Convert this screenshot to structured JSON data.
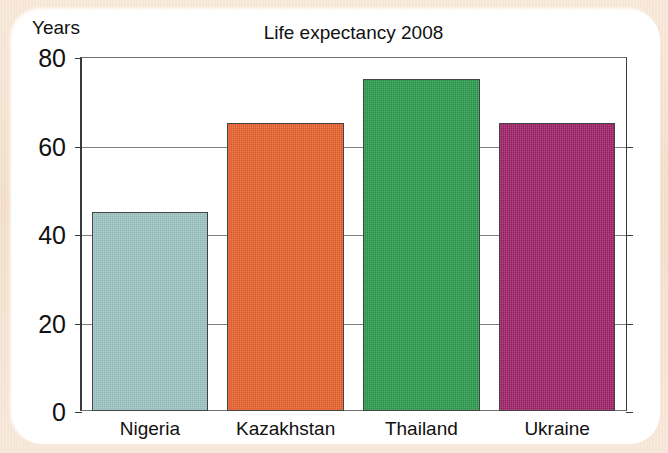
{
  "figure": {
    "background_color": "#f3ddc8",
    "card_color": "#ffffff"
  },
  "chart_data": {
    "type": "bar",
    "title": "Life expectancy 2008",
    "xlabel": "",
    "ylabel": "Years",
    "categories": [
      "Nigeria",
      "Kazakhstan",
      "Thailand",
      "Ukraine"
    ],
    "values": [
      45,
      65,
      75,
      65
    ],
    "colors": [
      "#9cc5c4",
      "#e8612c",
      "#2b9a4b",
      "#9e2168"
    ],
    "ylim": [
      0,
      80
    ],
    "yticks": [
      0,
      20,
      40,
      60,
      80
    ],
    "ytick_labels": [
      "0",
      "20",
      "40",
      "60",
      "80"
    ],
    "grid": true,
    "legend": false,
    "bar_edge_color": "#444444",
    "axis_color": "#3a3a3a"
  }
}
